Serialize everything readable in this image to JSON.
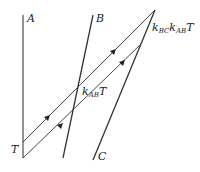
{
  "diagram": {
    "type": "spacetime-diagram",
    "labels": {
      "a": "A",
      "b": "B",
      "c": "C",
      "t": "T",
      "k_ab_t": {
        "k": "k",
        "sub": "AB",
        "t": "T"
      },
      "k_bc_k_ab_t": {
        "k1": "k",
        "sub1": "BC",
        "k2": "k",
        "sub2": "AB",
        "t": "T"
      }
    },
    "worldlines": [
      {
        "name": "A",
        "from": [
          23,
          15
        ],
        "to": [
          23,
          158
        ]
      },
      {
        "name": "B",
        "from": [
          93,
          15
        ],
        "to": [
          63,
          158
        ]
      },
      {
        "name": "C",
        "from": [
          155,
          10
        ],
        "to": [
          93,
          160
        ]
      }
    ],
    "signals": [
      {
        "name": "upper-signal",
        "from": [
          23,
          142
        ],
        "to": [
          155,
          10
        ]
      },
      {
        "name": "lower-signal",
        "from": [
          23,
          158
        ],
        "to": [
          140,
          45
        ]
      }
    ],
    "colors": {
      "line": "#333333",
      "worldline_a": "#777777",
      "background": "#ffffff"
    }
  }
}
